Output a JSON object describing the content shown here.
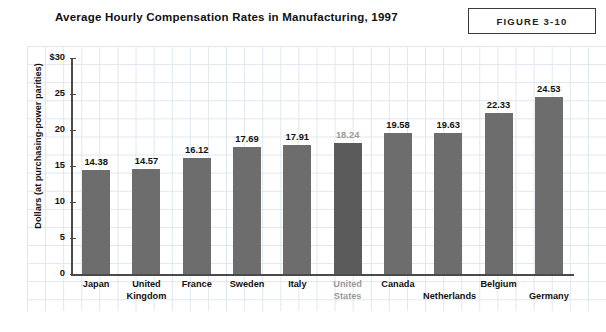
{
  "header": {
    "title": "Average Hourly Compensation Rates in Manufacturing, 1997",
    "figure_label": "FIGURE 3-10"
  },
  "chart_data": {
    "type": "bar",
    "title": "Average Hourly Compensation Rates in Manufacturing, 1997",
    "xlabel": "",
    "ylabel": "Dollars (at purchasing-power parities)",
    "ylim": [
      0,
      30
    ],
    "yticks": [
      0,
      5,
      10,
      15,
      20,
      25,
      30
    ],
    "ytick_labels": [
      "0",
      "5",
      "10",
      "15",
      "20",
      "25",
      "$30"
    ],
    "grid": true,
    "legend": "none",
    "bar_color": "#6d6d6d",
    "highlight_color": "#5b5b5b",
    "highlight_text_color": "#9a9a9a",
    "categories": [
      "Japan",
      "United Kingdom",
      "France",
      "Sweden",
      "Italy",
      "United States",
      "Canada",
      "Netherlands",
      "Belgium",
      "Germany"
    ],
    "values": [
      14.38,
      14.57,
      16.12,
      17.69,
      17.91,
      18.24,
      19.58,
      19.63,
      22.33,
      24.53
    ],
    "value_labels": [
      "14.38",
      "14.57",
      "16.12",
      "17.69",
      "17.91",
      "18.24",
      "19.58",
      "19.63",
      "22.33",
      "24.53"
    ],
    "category_lines": [
      [
        "Japan"
      ],
      [
        "United",
        "Kingdom"
      ],
      [
        "France"
      ],
      [
        "Sweden"
      ],
      [
        "Italy"
      ],
      [
        "United",
        "States"
      ],
      [
        "Canada"
      ],
      [
        "Netherlands"
      ],
      [
        "Belgium"
      ],
      [
        "Germany"
      ]
    ],
    "highlight_index": 5,
    "label_drop_indices": [
      7,
      9
    ]
  }
}
